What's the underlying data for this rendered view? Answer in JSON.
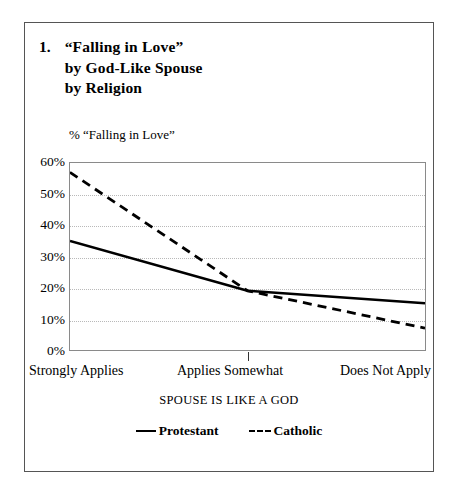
{
  "figure": {
    "number": "1.",
    "title_lines": [
      "“Falling in Love”",
      "by God-Like Spouse",
      "by Religion"
    ],
    "y_axis_caption": "% “Falling in Love”",
    "x_axis_title": "SPOUSE IS LIKE A GOD"
  },
  "chart_data": {
    "type": "line",
    "title": "1. “Falling in Love” by God-Like Spouse by Religion",
    "xlabel": "SPOUSE IS LIKE A GOD",
    "ylabel": "% “Falling in Love”",
    "categories": [
      "Strongly Applies",
      "Applies Somewhat",
      "Does Not Apply"
    ],
    "ytick_labels": [
      "60%",
      "50%",
      "40%",
      "30%",
      "20%",
      "10%",
      "0%"
    ],
    "ytick_values": [
      60,
      50,
      40,
      30,
      20,
      10,
      0
    ],
    "ylim": [
      0,
      60
    ],
    "grid": true,
    "legend_position": "bottom",
    "series": [
      {
        "name": "Protestant",
        "style": "solid",
        "color": "#000000",
        "values": [
          35,
          19,
          15
        ]
      },
      {
        "name": "Catholic",
        "style": "dashed",
        "color": "#000000",
        "values": [
          57,
          19,
          7
        ]
      }
    ]
  },
  "legend": {
    "items": [
      {
        "label": "Protestant",
        "marker": "solid-line-swatch"
      },
      {
        "label": "Catholic",
        "marker": "dashed-line-swatch"
      }
    ]
  }
}
